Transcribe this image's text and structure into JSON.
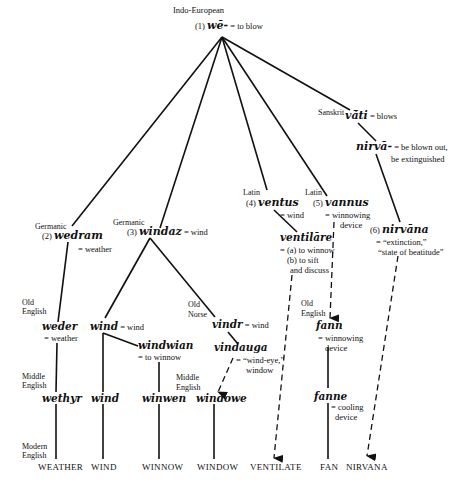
{
  "title": "Indo-European",
  "root": {
    "num": "(1)",
    "word": "wē-",
    "gloss": "= to blow"
  },
  "sanskrit": {
    "lang": "Sanskrit",
    "vati": {
      "word": "vā́ti",
      "gloss": "= blows"
    },
    "nirva": {
      "word": "nirvā-",
      "gloss1": "= be blown out,",
      "gloss2": "be extinguished"
    },
    "nirvana": {
      "num": "(6)",
      "word": "nirvāna",
      "gloss1": "= “extinction,”",
      "gloss2": "“state of beatitude”"
    }
  },
  "germanic_a": {
    "lang": "Germanic",
    "num": "(2)",
    "word": "wedram",
    "gloss": "= weather"
  },
  "germanic_b": {
    "lang": "Germanic",
    "num": "(3)",
    "word": "windaz",
    "gloss": "= wind"
  },
  "latin_a": {
    "lang": "Latin",
    "num": "(4)",
    "word": "ventus",
    "gloss": "= wind",
    "ventilare": {
      "word": "ventilāre",
      "gloss1": "= (a) to winnow",
      "gloss2": "(b) to sift",
      "gloss3": "and discuss"
    }
  },
  "latin_b": {
    "lang": "Latin",
    "num": "(5)",
    "word": "vannus",
    "gloss1": "= winnowing",
    "gloss2": "device"
  },
  "period_labels": {
    "old_english": [
      "Old",
      "English"
    ],
    "middle_english": [
      "Middle",
      "English"
    ],
    "modern_english": [
      "Modern",
      "English"
    ],
    "old_norse": [
      "Old",
      "Norse"
    ],
    "old_english_b": [
      "Old",
      "English"
    ],
    "middle_english_b": [
      "Middle",
      "English"
    ]
  },
  "old_english": {
    "weder": {
      "word": "weder",
      "gloss": "= weather"
    },
    "wind": {
      "word": "wind",
      "gloss": "= wind"
    },
    "windwian": {
      "word": "windwian",
      "gloss": "= to winnow"
    },
    "fann": {
      "word": "fann",
      "gloss1": "= winnowing",
      "gloss2": "device"
    }
  },
  "old_norse": {
    "vindr": {
      "word": "vindr",
      "gloss": "= wind"
    },
    "vindauga": {
      "word": "vindauga",
      "gloss1": "= “wind-eye,”",
      "gloss2": "window"
    }
  },
  "middle_english": {
    "wethyr": "wethyr",
    "wind": "wind",
    "winwen": "winwen",
    "windowe": "windowe",
    "fanne": {
      "word": "fanne",
      "gloss1": "= cooling",
      "gloss2": "device"
    }
  },
  "modern_english": [
    "WEATHER",
    "WIND",
    "WINNOW",
    "WINDOW",
    "VENTILATE",
    "FAN",
    "NIRVANA"
  ]
}
